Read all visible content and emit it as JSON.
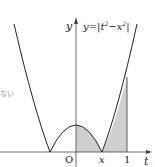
{
  "diagram": {
    "equation_label": "y=|t²−x²|",
    "equation_parts": {
      "y": "y",
      "eq": "=",
      "bar_l": "|",
      "t": "t",
      "sup_t": "2",
      "minus": "−",
      "x": "x",
      "sup_x": "2",
      "bar_r": "|"
    },
    "axis_labels": {
      "y": "y",
      "t": "t"
    },
    "tick_labels": {
      "origin": "O",
      "x": "x",
      "one": "1"
    },
    "side_text": "ない",
    "colors": {
      "curve": "#222222",
      "shade": "#cfcfcf",
      "axis": "#444444",
      "background": "#ffffff"
    },
    "shaded_interval": {
      "from": "0",
      "to": "1"
    }
  }
}
